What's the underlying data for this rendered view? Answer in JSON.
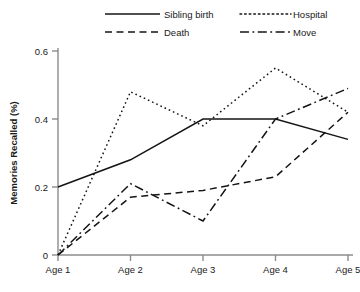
{
  "chart_data": {
    "type": "line",
    "title": "",
    "xlabel": "",
    "ylabel": "Memories Recalled (%)",
    "categories": [
      "Age 1",
      "Age 2",
      "Age 3",
      "Age 4",
      "Age 5"
    ],
    "ylim": [
      0,
      0.65
    ],
    "yticks": [
      "0",
      "0.2",
      "0.4",
      "0.6"
    ],
    "ytick_values": [
      0,
      0.2,
      0.4,
      0.6
    ],
    "grid": false,
    "legend_position": "top",
    "series": [
      {
        "name": "Sibling birth",
        "style": "solid",
        "values": [
          0.2,
          0.28,
          0.4,
          0.4,
          0.34
        ]
      },
      {
        "name": "Hospital",
        "style": "dotted",
        "values": [
          0,
          0.48,
          0.38,
          0.55,
          0.42
        ]
      },
      {
        "name": "Death",
        "style": "dashed",
        "values": [
          0,
          0.17,
          0.19,
          0.23,
          0.42
        ]
      },
      {
        "name": "Move",
        "style": "dashdot",
        "values": [
          0,
          0.21,
          0.1,
          0.4,
          0.49
        ]
      }
    ],
    "colors": {
      "line": "#141414",
      "axis": "#8c8c8c",
      "text": "#1a1a1a",
      "background": "#ffffff"
    }
  }
}
